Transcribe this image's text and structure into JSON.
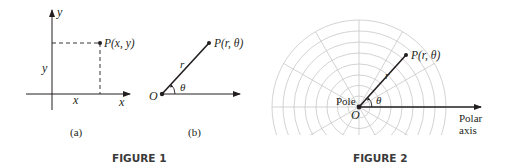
{
  "figure1": {
    "caption": "FIGURE 1",
    "panel_a": {
      "sublabel": "(a)",
      "axis_x": "x",
      "axis_y": "y",
      "point_label": "P(x, y)",
      "x_coord_label": "x",
      "y_coord_label": "y"
    },
    "panel_b": {
      "sublabel": "(b)",
      "origin_label": "O",
      "point_label": "P(r, θ)",
      "radius_label": "r",
      "angle_label": "θ"
    }
  },
  "figure2": {
    "caption": "FIGURE 2",
    "pole_label": "Pole",
    "origin_label": "O",
    "point_label": "P(r, θ)",
    "radius_label": "r",
    "angle_label": "θ",
    "axis_label_line1": "Polar",
    "axis_label_line2": "axis",
    "grid_color": "#c8c8c8"
  }
}
